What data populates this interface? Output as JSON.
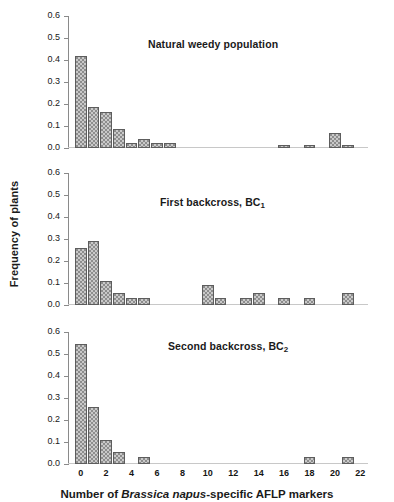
{
  "figure": {
    "ylabel": "Frequency of plants",
    "xlabel_prefix": "Number of ",
    "xlabel_italic": "Brassica napus",
    "xlabel_suffix": "-specific AFLP markers"
  },
  "axis": {
    "y_ticks": [
      "0.0",
      "0.1",
      "0.2",
      "0.3",
      "0.4",
      "0.5",
      "0.6"
    ],
    "x_ticks": [
      "0",
      "2",
      "4",
      "6",
      "8",
      "10",
      "12",
      "14",
      "16",
      "18",
      "20",
      "22"
    ]
  },
  "panels": [
    {
      "title": "Natural weedy population",
      "title_sub": ""
    },
    {
      "title": "First backcross, BC",
      "title_sub": "1"
    },
    {
      "title": "Second backcross, BC",
      "title_sub": "2"
    }
  ],
  "chart_data": [
    {
      "type": "bar",
      "title": "Natural weedy population",
      "xlabel": "Number of Brassica napus-specific AFLP markers",
      "ylabel": "Frequency of plants",
      "xlim": [
        -1,
        22.5
      ],
      "ylim": [
        0.0,
        0.6
      ],
      "xticks": [
        0,
        2,
        4,
        6,
        8,
        10,
        12,
        14,
        16,
        18,
        20,
        22
      ],
      "yticks": [
        0.0,
        0.1,
        0.2,
        0.3,
        0.4,
        0.5,
        0.6
      ],
      "grid": false,
      "legend": "none",
      "x": [
        0,
        1,
        2,
        3,
        4,
        5,
        6,
        7,
        16,
        18,
        20,
        21
      ],
      "values": [
        0.42,
        0.185,
        0.165,
        0.085,
        0.025,
        0.04,
        0.025,
        0.025,
        0.012,
        0.012,
        0.07,
        0.012
      ]
    },
    {
      "type": "bar",
      "title": "First backcross, BC1",
      "xlabel": "Number of Brassica napus-specific AFLP markers",
      "ylabel": "Frequency of plants",
      "xlim": [
        -1,
        22.5
      ],
      "ylim": [
        0.0,
        0.6
      ],
      "xticks": [
        0,
        2,
        4,
        6,
        8,
        10,
        12,
        14,
        16,
        18,
        20,
        22
      ],
      "yticks": [
        0.0,
        0.1,
        0.2,
        0.3,
        0.4,
        0.5,
        0.6
      ],
      "grid": false,
      "legend": "none",
      "x": [
        0,
        1,
        2,
        3,
        4,
        5,
        10,
        11,
        13,
        14,
        16,
        18,
        21
      ],
      "values": [
        0.26,
        0.29,
        0.11,
        0.055,
        0.03,
        0.03,
        0.09,
        0.03,
        0.03,
        0.055,
        0.03,
        0.03,
        0.055
      ]
    },
    {
      "type": "bar",
      "title": "Second backcross, BC2",
      "xlabel": "Number of Brassica napus-specific AFLP markers",
      "ylabel": "Frequency of plants",
      "xlim": [
        -1,
        22.5
      ],
      "ylim": [
        0.0,
        0.6
      ],
      "xticks": [
        0,
        2,
        4,
        6,
        8,
        10,
        12,
        14,
        16,
        18,
        20,
        22
      ],
      "yticks": [
        0.0,
        0.1,
        0.2,
        0.3,
        0.4,
        0.5,
        0.6
      ],
      "grid": false,
      "legend": "none",
      "x": [
        0,
        1,
        2,
        3,
        5,
        18,
        21
      ],
      "values": [
        0.545,
        0.26,
        0.11,
        0.055,
        0.03,
        0.03,
        0.03
      ]
    }
  ]
}
